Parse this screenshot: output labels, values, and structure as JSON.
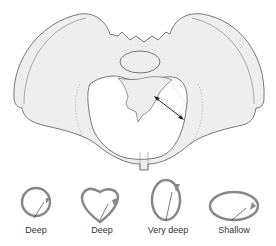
{
  "figure": {
    "colors": {
      "bone_fill": "#eeeeee",
      "outline": "#555555",
      "socket_ring": "#888888",
      "arrow": "#222222"
    }
  },
  "sockets": [
    {
      "shape": "round",
      "label": "Deep"
    },
    {
      "shape": "heart",
      "label": "Deep"
    },
    {
      "shape": "tall-oval",
      "label": "Very deep"
    },
    {
      "shape": "wide-oval",
      "label": "Shallow"
    }
  ]
}
